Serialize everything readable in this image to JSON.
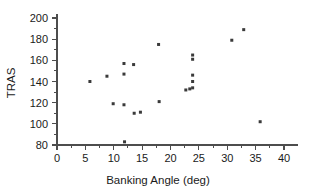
{
  "chart_data": {
    "type": "scatter",
    "title": "",
    "xlabel": "Banking Angle (deg)",
    "ylabel": "TRAS",
    "xlim": [
      0,
      42.5
    ],
    "ylim": [
      78,
      204
    ],
    "grid": false,
    "legend": null,
    "xticks": [
      0,
      5,
      10,
      15,
      20,
      25,
      30,
      35,
      40
    ],
    "xtick_labels": [
      "0",
      "5",
      "10",
      "15",
      "20",
      "25",
      "30",
      "35",
      "40"
    ],
    "xminor_ticks": [
      2.5,
      7.5,
      12.5,
      17.5,
      22.5,
      27.5,
      32.5,
      37.5
    ],
    "yticks": [
      80,
      100,
      120,
      140,
      160,
      180,
      200
    ],
    "ytick_labels": [
      "80",
      "100",
      "120",
      "140",
      "160",
      "180",
      "200"
    ],
    "yminor_ticks": [
      90,
      110,
      130,
      150,
      170,
      190
    ],
    "marker": "square",
    "marker_color": "#3a3a3a",
    "marker_size": 3,
    "points": [
      {
        "x": 5.8,
        "y": 140
      },
      {
        "x": 8.8,
        "y": 145
      },
      {
        "x": 9.9,
        "y": 119
      },
      {
        "x": 11.8,
        "y": 157
      },
      {
        "x": 11.8,
        "y": 147
      },
      {
        "x": 11.8,
        "y": 118
      },
      {
        "x": 11.9,
        "y": 83
      },
      {
        "x": 13.5,
        "y": 156
      },
      {
        "x": 13.6,
        "y": 110
      },
      {
        "x": 14.7,
        "y": 111
      },
      {
        "x": 17.9,
        "y": 175
      },
      {
        "x": 18.0,
        "y": 121
      },
      {
        "x": 22.7,
        "y": 132
      },
      {
        "x": 23.9,
        "y": 165
      },
      {
        "x": 23.9,
        "y": 161
      },
      {
        "x": 23.9,
        "y": 146
      },
      {
        "x": 23.9,
        "y": 140
      },
      {
        "x": 23.9,
        "y": 134
      },
      {
        "x": 23.4,
        "y": 133
      },
      {
        "x": 30.8,
        "y": 179
      },
      {
        "x": 32.9,
        "y": 189
      },
      {
        "x": 35.8,
        "y": 102
      }
    ]
  }
}
